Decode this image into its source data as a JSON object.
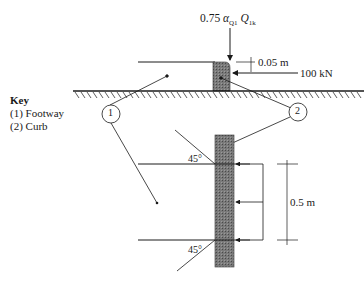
{
  "diagram": {
    "load_label": {
      "coef": "0.75",
      "alpha": "α",
      "alpha_sub": "Q1",
      "q": "Q",
      "q_sub": "1k"
    },
    "offset_label": "0.05 m",
    "force_label": "100 kN",
    "height_label": "0.5 m",
    "angle_top": "45°",
    "angle_bottom": "45°",
    "callouts": [
      {
        "id": "1",
        "label": "1"
      },
      {
        "id": "2",
        "label": "2"
      }
    ],
    "key": {
      "title": "Key",
      "items": [
        "(1) Footway",
        "(2) Curb"
      ]
    },
    "colors": {
      "line": "#1a1a1a",
      "curb_fill": "#6e6e6e"
    }
  }
}
